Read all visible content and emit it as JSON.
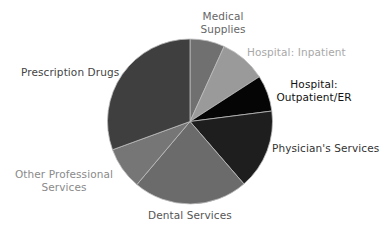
{
  "chart_data": {
    "type": "pie",
    "title": "",
    "start_angle_deg": 0,
    "direction": "clockwise",
    "center": [
      190,
      121.5
    ],
    "radius": 82.5,
    "slices": [
      {
        "label": "Medical Supplies",
        "lines": [
          "Medical",
          "Supplies"
        ],
        "value": 6.8,
        "color": "#707070",
        "label_color": "#666666"
      },
      {
        "label": "Hospital: Inpatient",
        "lines": [
          "Hospital: Inpatient"
        ],
        "value": 9.1,
        "color": "#9a9a9a",
        "label_color": "#a8a8a8"
      },
      {
        "label": "Hospital: Outpatient/ER",
        "lines": [
          "Hospital:",
          "Outpatient/ER"
        ],
        "value": 7.1,
        "color": "#050505",
        "label_color": "#111111"
      },
      {
        "label": "Physician's Services",
        "lines": [
          "Physician's Services"
        ],
        "value": 15.7,
        "color": "#1e1e1e",
        "label_color": "#333333"
      },
      {
        "label": "Dental Services",
        "lines": [
          "Dental Services"
        ],
        "value": 22.5,
        "color": "#6b6b6b",
        "label_color": "#555555"
      },
      {
        "label": "Other Professional Services",
        "lines": [
          "Other Professional",
          "Services"
        ],
        "value": 8.3,
        "color": "#767676",
        "label_color": "#8a8a8a"
      },
      {
        "label": "Prescription Drugs",
        "lines": [
          "Prescription Drugs"
        ],
        "value": 30.6,
        "color": "#3f3f3f",
        "label_color": "#444444"
      }
    ],
    "units": "percent (estimated from slice angles)",
    "legend": "none (direct labels)"
  }
}
